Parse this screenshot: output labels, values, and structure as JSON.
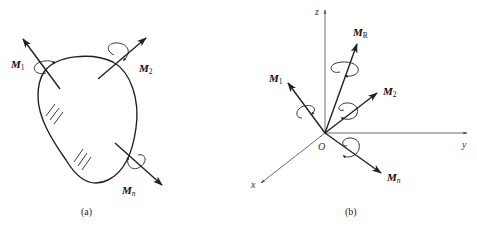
{
  "figure_a": {
    "caption": "(a)",
    "body": "rigid-body",
    "moments": [
      {
        "symbol": "M",
        "subscript": "1",
        "direction": "up-left"
      },
      {
        "symbol": "M",
        "subscript": "2",
        "direction": "up-right"
      },
      {
        "symbol": "M",
        "subscript": "n",
        "direction": "down-right"
      }
    ]
  },
  "figure_b": {
    "caption": "(b)",
    "origin_label": "O",
    "axes": {
      "x": "x",
      "y": "y",
      "z": "z"
    },
    "moments": [
      {
        "symbol": "M",
        "subscript": "R",
        "direction": "up-right steep"
      },
      {
        "symbol": "M",
        "subscript": "1",
        "direction": "up-left"
      },
      {
        "symbol": "M",
        "subscript": "2",
        "direction": "up-right"
      },
      {
        "symbol": "M",
        "subscript": "n",
        "direction": "down-right"
      }
    ]
  },
  "colors": {
    "stroke": "#222222",
    "axis": "#444444",
    "background": "#ffffff"
  }
}
